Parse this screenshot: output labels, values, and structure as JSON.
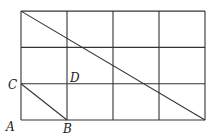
{
  "figure": {
    "grid": {
      "columns": 4,
      "rows": 3
    },
    "points": [
      {
        "label": "A",
        "grid": [
          0,
          0
        ]
      },
      {
        "label": "B",
        "grid": [
          1,
          0
        ]
      },
      {
        "label": "C",
        "grid": [
          0,
          1
        ]
      },
      {
        "label": "D",
        "grid": [
          1,
          1
        ]
      }
    ],
    "segments": [
      {
        "name": "main-diagonal",
        "from": [
          0,
          3
        ],
        "to": [
          4,
          0
        ]
      },
      {
        "name": "segment-cb",
        "from": [
          0,
          1
        ],
        "to": [
          1,
          0
        ]
      }
    ]
  }
}
